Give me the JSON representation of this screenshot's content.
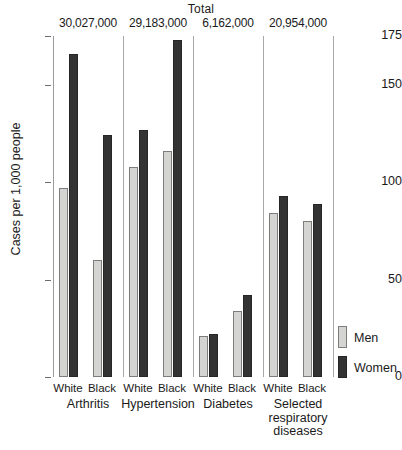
{
  "chart_data": {
    "type": "bar",
    "title": "",
    "xlabel": "",
    "ylabel": "Cases per 1,000 people",
    "ylim": [
      0,
      175
    ],
    "yticks": [
      0,
      50,
      100,
      150,
      175
    ],
    "ytick_labels": [
      "0",
      "50",
      "100",
      "150",
      "175"
    ],
    "grid": false,
    "legend_position": "right-bottom",
    "total_header": "Total",
    "legend": [
      {
        "name": "Men",
        "color": "#d4d4d2"
      },
      {
        "name": "Women",
        "color": "#333333"
      }
    ],
    "series": [
      {
        "name": "Men",
        "color": "#d4d4d2",
        "values": [
          97,
          60,
          108,
          116,
          21,
          34,
          84,
          80
        ]
      },
      {
        "name": "Women",
        "color": "#333333",
        "values": [
          166,
          124,
          127,
          173,
          22,
          42,
          93,
          89
        ]
      }
    ],
    "categories": [
      "Arthritis / White",
      "Arthritis / Black",
      "Hypertension / White",
      "Hypertension / Black",
      "Diabetes / White",
      "Diabetes / Black",
      "Selected respiratory diseases / White",
      "Selected respiratory diseases / Black"
    ],
    "groups": [
      {
        "label": "Arthritis",
        "total": "30,027,000",
        "races": [
          {
            "label": "White",
            "men": 97,
            "women": 166
          },
          {
            "label": "Black",
            "men": 60,
            "women": 124
          }
        ]
      },
      {
        "label": "Hypertension",
        "total": "29,183,000",
        "races": [
          {
            "label": "White",
            "men": 108,
            "women": 127
          },
          {
            "label": "Black",
            "men": 116,
            "women": 173
          }
        ]
      },
      {
        "label": "Diabetes",
        "total": "6,162,000",
        "races": [
          {
            "label": "White",
            "men": 21,
            "women": 22
          },
          {
            "label": "Black",
            "men": 34,
            "women": 42
          }
        ]
      },
      {
        "label": "Selected respiratory diseases",
        "total": "20,954,000",
        "races": [
          {
            "label": "White",
            "men": 84,
            "women": 93
          },
          {
            "label": "Black",
            "men": 80,
            "women": 89
          }
        ]
      }
    ]
  }
}
